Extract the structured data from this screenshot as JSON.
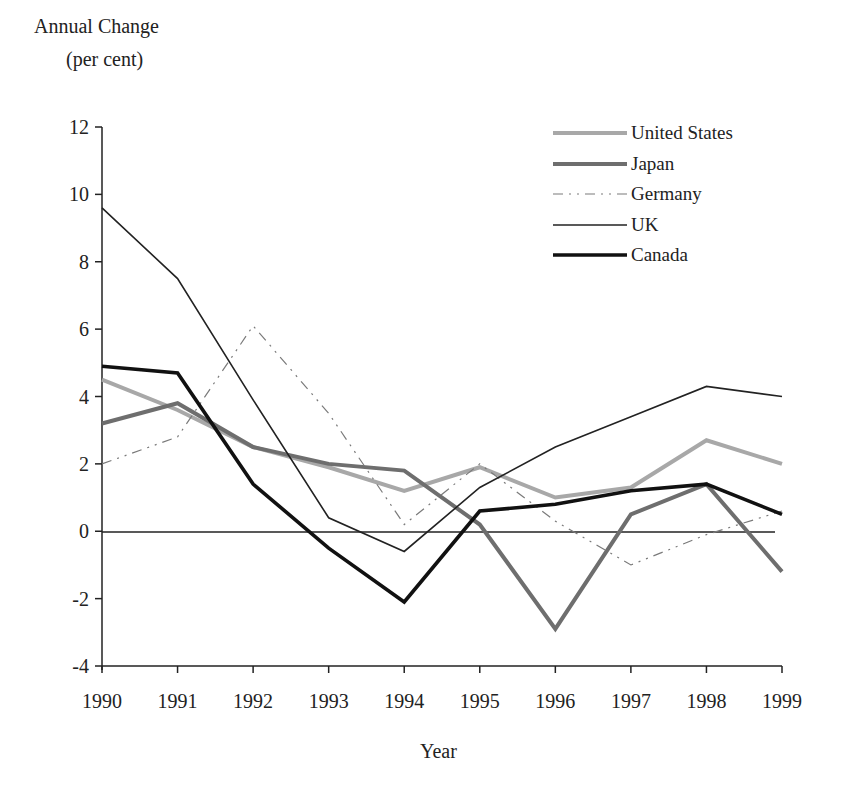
{
  "chart_data": {
    "type": "line",
    "title": "",
    "ylabel": [
      "Annual Change",
      "(per cent)"
    ],
    "xlabel": "Year",
    "x": [
      "1990",
      "1991",
      "1992",
      "1993",
      "1994",
      "1995",
      "1996",
      "1997",
      "1998",
      "1999"
    ],
    "ylim": [
      -4,
      12
    ],
    "yticks": [
      "12",
      "10",
      "8",
      "6",
      "4",
      "2",
      "0",
      "-2",
      "-4"
    ],
    "grid": false,
    "legend_position": "top-right",
    "series": [
      {
        "name": "United States",
        "color": "#a8a8a8",
        "width": 4,
        "dash": "",
        "values": [
          4.5,
          3.6,
          2.5,
          1.9,
          1.2,
          1.9,
          1.0,
          1.3,
          2.7,
          2.0
        ]
      },
      {
        "name": "Japan",
        "color": "#6e6e6e",
        "width": 4,
        "dash": "",
        "values": [
          3.2,
          3.8,
          2.5,
          2.0,
          1.8,
          0.2,
          -2.9,
          0.5,
          1.4,
          -1.2
        ]
      },
      {
        "name": "Germany",
        "color": "#7a7a7a",
        "width": 1.2,
        "dash": "10 6 2 6 2 6",
        "values": [
          2.0,
          2.8,
          6.1,
          3.5,
          0.2,
          2.0,
          0.3,
          -1.0,
          -0.1,
          0.6
        ]
      },
      {
        "name": "UK",
        "color": "#222222",
        "width": 1.6,
        "dash": "",
        "values": [
          9.6,
          7.5,
          3.9,
          0.4,
          -0.6,
          1.3,
          2.5,
          3.4,
          4.3,
          4.0
        ]
      },
      {
        "name": "Canada",
        "color": "#111111",
        "width": 3.6,
        "dash": "",
        "values": [
          4.9,
          4.7,
          1.4,
          -0.5,
          -2.1,
          0.6,
          0.8,
          1.2,
          1.4,
          0.5
        ]
      }
    ]
  }
}
